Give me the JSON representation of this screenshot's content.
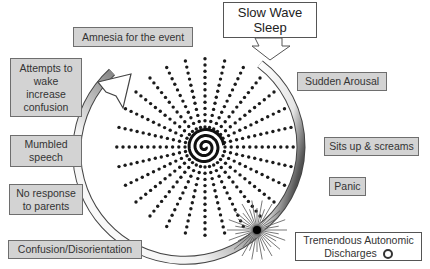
{
  "diagram": {
    "title": "Slow Wave Sleep",
    "center_label": "",
    "steps": [
      {
        "id": "sudden-arousal",
        "label": "Sudden Arousal"
      },
      {
        "id": "sits-up-screams",
        "label": "Sits up & screams"
      },
      {
        "id": "panic",
        "label": "Panic"
      },
      {
        "id": "autonomic-discharges",
        "label": "Tremendous Autonomic Discharges",
        "suffix_icon": "circle-icon"
      },
      {
        "id": "confusion-disorientation",
        "label": "Confusion/Disorientation"
      },
      {
        "id": "no-response",
        "label": "No response to parents"
      },
      {
        "id": "mumbled-speech",
        "label": "Mumbled speech"
      },
      {
        "id": "attempts-wake",
        "label": "Attempts to wake increase confusion"
      },
      {
        "id": "amnesia",
        "label": "Amnesia for the event"
      }
    ],
    "colors": {
      "box_fill": "#d3d3d3",
      "box_border": "#6e6e6e",
      "dots": "#1a1a1a",
      "arc_dark": "#1a1a1a",
      "arc_light": "#ffffff"
    }
  }
}
